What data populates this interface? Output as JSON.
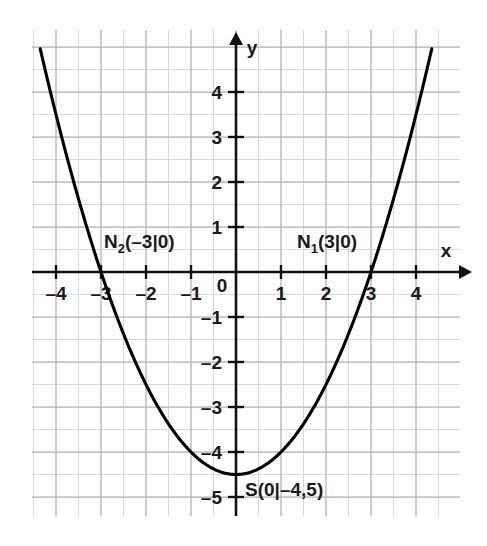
{
  "chart_data": {
    "type": "line",
    "title": "",
    "subtitle": "",
    "xlabel": "x",
    "ylabel": "y",
    "xlim": [
      -4.55,
      5.0
    ],
    "ylim": [
      -5.45,
      5.4
    ],
    "grid": true,
    "minor_grid_step": 0.5,
    "major_grid_step": 1.0,
    "legend": "none",
    "function_expression": "y = 0.5x^2 - 4.5",
    "series": [
      {
        "name": "parabola",
        "color": "#000000",
        "x": [
          -4.35,
          -4.0,
          -3.5,
          -3.0,
          -2.5,
          -2.0,
          -1.5,
          -1.0,
          -0.5,
          0.0,
          0.5,
          1.0,
          1.5,
          2.0,
          2.5,
          3.0,
          3.5,
          4.0,
          4.35
        ],
        "values": [
          4.96,
          3.5,
          1.625,
          0.0,
          -1.375,
          -2.5,
          -3.375,
          -4.0,
          -4.375,
          -4.5,
          -4.375,
          -4.0,
          -3.375,
          -2.5,
          -1.375,
          0.0,
          1.625,
          3.5,
          4.96
        ]
      }
    ],
    "x_ticks": [
      -4,
      -3,
      -2,
      -1,
      1,
      2,
      3,
      4
    ],
    "x_tick_labels": [
      "-4",
      "-3",
      "-2",
      "-1",
      "1",
      "2",
      "3",
      "4"
    ],
    "y_ticks": [
      4,
      3,
      2,
      1,
      -1,
      -2,
      -3,
      -4,
      -5
    ],
    "y_tick_labels": [
      "4",
      "3",
      "2",
      "1",
      "-1",
      "-2",
      "-3",
      "-4",
      "-5"
    ],
    "origin_label": "0",
    "annotations": [
      {
        "name": "root-2",
        "base": "N",
        "subscript": "2",
        "coords": "(-3|0)",
        "full_text": "N2(-3|0)",
        "point_x": -3,
        "point_y": 0
      },
      {
        "name": "root-1",
        "base": "N",
        "subscript": "1",
        "coords": "(3|0)",
        "full_text": "N1(3|0)",
        "point_x": 3,
        "point_y": 0
      },
      {
        "name": "vertex",
        "base": "S",
        "subscript": "",
        "coords": "(0|-4,5)",
        "full_text": "S(0|-4,5)",
        "point_x": 0,
        "point_y": -4.5
      }
    ]
  },
  "colors": {
    "curve": "#000000",
    "axis": "#111111",
    "grid_major": "#b9b9bd",
    "grid_minor": "#d8d8dc",
    "background": "#ffffff",
    "text": "#1a1a1a"
  },
  "axes": {
    "x_axis_name": "x",
    "y_axis_name": "y"
  }
}
